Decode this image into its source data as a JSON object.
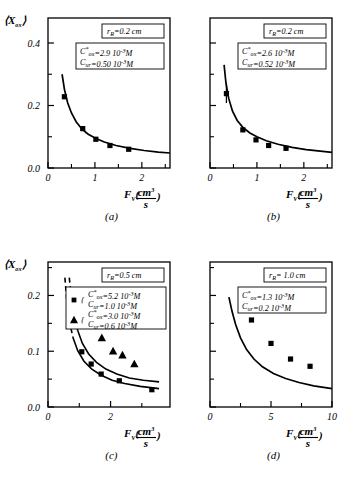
{
  "figure": {
    "n_panels": 4,
    "background": "#ffffff",
    "ink": "#000000"
  },
  "axis": {
    "ylabel_main": "⟨X",
    "ylabel_sub": "ox",
    "ylabel_close": "⟩",
    "xlabel_f": "F",
    "xlabel_v": "V",
    "xlabel_num": "cm",
    "xlabel_num_sup": "3",
    "xlabel_den": "s"
  },
  "chart_data": [
    {
      "type": "scatter",
      "panel": "a",
      "panel_label": "(a)",
      "title": "",
      "xlabel": "F_V (cm^3/s)",
      "ylabel": "<X_ox>",
      "xlim": [
        0,
        2.6
      ],
      "ylim": [
        0.0,
        0.48
      ],
      "xticks": [
        0,
        1,
        2
      ],
      "xticklabels": [
        "0",
        "1",
        "2"
      ],
      "xminorticks": [
        0.5,
        1.5,
        2.5
      ],
      "yticks": [
        0.0,
        0.2,
        0.4
      ],
      "yticklabels": [
        "0.0",
        "0.2",
        "0.4"
      ],
      "yminorticks": [
        0.1,
        0.3
      ],
      "grid": false,
      "annotations": [
        {
          "name": "radius-box",
          "lines": [
            "r_R = 0.2 cm"
          ]
        },
        {
          "name": "concentration-box",
          "lines": [
            "C*ox = 2.9   10^-3 M",
            "Cur = 0.50   10^-3 M"
          ]
        }
      ],
      "box_radius": {
        "var": "r",
        "sub": "R",
        "eq": "=0.2",
        "unit": "cm"
      },
      "box_conc": {
        "row1": {
          "var": "C",
          "sup": "*",
          "sub": "ox",
          "eq": "=2.9",
          "exp_base": "10",
          "exp": "-3",
          "unit": "M"
        },
        "row2": {
          "var": "C",
          "sup": "",
          "sub": "ur",
          "eq": "=0.50",
          "exp_base": "10",
          "exp": "-3",
          "unit": "M"
        }
      },
      "series": [
        {
          "name": "measured",
          "marker": "square",
          "points": [
            {
              "x": 0.35,
              "y": 0.228,
              "err": 0
            },
            {
              "x": 0.74,
              "y": 0.126,
              "err": 0
            },
            {
              "x": 1.02,
              "y": 0.092,
              "err": 0
            },
            {
              "x": 1.32,
              "y": 0.072,
              "err": 0
            },
            {
              "x": 1.72,
              "y": 0.06,
              "err": 0
            }
          ]
        }
      ],
      "curves": [
        {
          "name": "model-solid",
          "style": "solid",
          "points": [
            {
              "x": 0.3,
              "y": 0.3
            },
            {
              "x": 0.35,
              "y": 0.252
            },
            {
              "x": 0.42,
              "y": 0.208
            },
            {
              "x": 0.5,
              "y": 0.176
            },
            {
              "x": 0.6,
              "y": 0.148
            },
            {
              "x": 0.72,
              "y": 0.125
            },
            {
              "x": 0.85,
              "y": 0.109
            },
            {
              "x": 1.0,
              "y": 0.096
            },
            {
              "x": 1.2,
              "y": 0.083
            },
            {
              "x": 1.45,
              "y": 0.072
            },
            {
              "x": 1.75,
              "y": 0.063
            },
            {
              "x": 2.05,
              "y": 0.056
            },
            {
              "x": 2.35,
              "y": 0.051
            },
            {
              "x": 2.6,
              "y": 0.048
            }
          ]
        }
      ]
    },
    {
      "type": "scatter",
      "panel": "b",
      "panel_label": "(b)",
      "title": "",
      "xlabel": "F_V (cm^3/s)",
      "ylabel": "",
      "xlim": [
        0,
        2.6
      ],
      "ylim": [
        0.0,
        0.48
      ],
      "xticks": [
        0,
        1,
        2
      ],
      "xticklabels": [
        "0",
        "1",
        "2"
      ],
      "xminorticks": [
        0.5,
        1.5,
        2.5
      ],
      "yticks": [
        0.0,
        0.2,
        0.4
      ],
      "yticklabels": [
        "",
        "",
        ""
      ],
      "yminorticks": [
        0.1,
        0.3
      ],
      "grid": false,
      "box_radius": {
        "var": "r",
        "sub": "R",
        "eq": "=0.2",
        "unit": "cm"
      },
      "box_conc": {
        "row1": {
          "var": "C",
          "sup": "*",
          "sub": "ox",
          "eq": "=2.6",
          "exp_base": "10",
          "exp": "-3",
          "unit": "M"
        },
        "row2": {
          "var": "C",
          "sup": "",
          "sub": "ur",
          "eq": "=0.52",
          "exp_base": "10",
          "exp": "-3",
          "unit": "M"
        }
      },
      "series": [
        {
          "name": "measured",
          "marker": "square",
          "points": [
            {
              "x": 0.35,
              "y": 0.238,
              "err": 0.03
            },
            {
              "x": 0.7,
              "y": 0.122,
              "err": 0
            },
            {
              "x": 0.98,
              "y": 0.09,
              "err": 0
            },
            {
              "x": 1.25,
              "y": 0.072,
              "err": 0
            },
            {
              "x": 1.62,
              "y": 0.063,
              "err": 0
            }
          ]
        }
      ],
      "curves": [
        {
          "name": "model-solid",
          "style": "solid",
          "points": [
            {
              "x": 0.3,
              "y": 0.33
            },
            {
              "x": 0.34,
              "y": 0.272
            },
            {
              "x": 0.4,
              "y": 0.222
            },
            {
              "x": 0.48,
              "y": 0.182
            },
            {
              "x": 0.58,
              "y": 0.152
            },
            {
              "x": 0.7,
              "y": 0.13
            },
            {
              "x": 0.85,
              "y": 0.112
            },
            {
              "x": 1.0,
              "y": 0.1
            },
            {
              "x": 1.2,
              "y": 0.087
            },
            {
              "x": 1.45,
              "y": 0.076
            },
            {
              "x": 1.75,
              "y": 0.066
            },
            {
              "x": 2.05,
              "y": 0.059
            },
            {
              "x": 2.35,
              "y": 0.054
            },
            {
              "x": 2.6,
              "y": 0.05
            }
          ]
        }
      ]
    },
    {
      "type": "scatter",
      "panel": "c",
      "panel_label": "(c)",
      "title": "",
      "xlabel": "F_V (cm^3/s)",
      "ylabel": "<X_ox>",
      "xlim": [
        0,
        3.9
      ],
      "ylim": [
        0.0,
        0.26
      ],
      "xticks": [
        0,
        2,
        4
      ],
      "xticklabels": [
        "0",
        "2",
        "4"
      ],
      "xminorticks": [
        1,
        3
      ],
      "yticks": [
        0.0,
        0.1,
        0.2
      ],
      "yticklabels": [
        "0.0",
        "0.1",
        "0.2"
      ],
      "yminorticks": [
        0.05,
        0.15,
        0.25
      ],
      "grid": false,
      "box_radius": {
        "var": "r",
        "sub": "R",
        "eq": "=0.5",
        "unit": "cm"
      },
      "legend": {
        "position": "top-right",
        "entries": [
          {
            "marker": "square",
            "row1": {
              "var": "C",
              "sup": "*",
              "sub": "ox",
              "eq": "=5.2",
              "exp_base": "10",
              "exp": "-3",
              "unit": "M"
            },
            "row2": {
              "var": "C",
              "sup": "",
              "sub": "ur",
              "eq": "=1.0",
              "exp_base": "10",
              "exp": "-3",
              "unit": "M"
            }
          },
          {
            "marker": "triangle",
            "row1": {
              "var": "C",
              "sup": "*",
              "sub": "ox",
              "eq": "=3.0",
              "exp_base": "10",
              "exp": "-3",
              "unit": "M"
            },
            "row2": {
              "var": "C",
              "sup": "",
              "sub": "ur",
              "eq": "=0.6",
              "exp_base": "10",
              "exp": "-3",
              "unit": "M"
            }
          }
        ]
      },
      "series": [
        {
          "name": "Cox-5.2",
          "marker": "square",
          "points": [
            {
              "x": 1.08,
              "y": 0.099
            },
            {
              "x": 1.38,
              "y": 0.077
            },
            {
              "x": 1.7,
              "y": 0.059
            },
            {
              "x": 2.28,
              "y": 0.047
            },
            {
              "x": 3.32,
              "y": 0.031
            }
          ]
        },
        {
          "name": "Cox-3.0",
          "marker": "triangle",
          "points": [
            {
              "x": 1.12,
              "y": 0.198
            },
            {
              "x": 1.42,
              "y": 0.153
            },
            {
              "x": 1.72,
              "y": 0.124
            },
            {
              "x": 2.08,
              "y": 0.1
            },
            {
              "x": 2.38,
              "y": 0.093
            },
            {
              "x": 2.76,
              "y": 0.077
            }
          ]
        }
      ],
      "curves": [
        {
          "name": "upper-model",
          "style": "dashed-then-solid",
          "dash_end_x": 0.95,
          "points": [
            {
              "x": 0.68,
              "y": 0.232
            },
            {
              "x": 0.75,
              "y": 0.196
            },
            {
              "x": 0.85,
              "y": 0.16
            },
            {
              "x": 0.95,
              "y": 0.137
            },
            {
              "x": 1.1,
              "y": 0.114
            },
            {
              "x": 1.3,
              "y": 0.095
            },
            {
              "x": 1.55,
              "y": 0.08
            },
            {
              "x": 1.85,
              "y": 0.068
            },
            {
              "x": 2.2,
              "y": 0.059
            },
            {
              "x": 2.6,
              "y": 0.052
            },
            {
              "x": 3.05,
              "y": 0.048
            },
            {
              "x": 3.55,
              "y": 0.045
            }
          ]
        },
        {
          "name": "lower-model",
          "style": "dashed-then-solid",
          "dash_end_x": 0.8,
          "points": [
            {
              "x": 0.54,
              "y": 0.232
            },
            {
              "x": 0.6,
              "y": 0.192
            },
            {
              "x": 0.68,
              "y": 0.155
            },
            {
              "x": 0.8,
              "y": 0.124
            },
            {
              "x": 0.95,
              "y": 0.101
            },
            {
              "x": 1.15,
              "y": 0.082
            },
            {
              "x": 1.4,
              "y": 0.068
            },
            {
              "x": 1.7,
              "y": 0.057
            },
            {
              "x": 2.05,
              "y": 0.048
            },
            {
              "x": 2.45,
              "y": 0.042
            },
            {
              "x": 2.95,
              "y": 0.037
            },
            {
              "x": 3.55,
              "y": 0.033
            }
          ]
        }
      ]
    },
    {
      "type": "scatter",
      "panel": "d",
      "panel_label": "(d)",
      "title": "",
      "xlabel": "F_V (cm^3/s)",
      "ylabel": "",
      "xlim": [
        0,
        10
      ],
      "ylim": [
        0.0,
        0.26
      ],
      "xticks": [
        0,
        5,
        10
      ],
      "xticklabels": [
        "0",
        "5",
        "10"
      ],
      "xminorticks": [
        2.5,
        7.5
      ],
      "yticks": [
        0.0,
        0.1,
        0.2
      ],
      "yticklabels": [
        "",
        "",
        ""
      ],
      "yminorticks": [
        0.05,
        0.15,
        0.25
      ],
      "grid": false,
      "box_radius": {
        "var": "r",
        "sub": "R",
        "eq": "= 1.0",
        "unit": "cm"
      },
      "box_conc": {
        "row1": {
          "var": "C",
          "sup": "*",
          "sub": "ox",
          "eq": "=1.3",
          "exp_base": "10",
          "exp": "-3",
          "unit": "M"
        },
        "row2": {
          "var": "C",
          "sup": "",
          "sub": "ur",
          "eq": "=0.2",
          "exp_base": "10",
          "exp": "-3",
          "unit": "M"
        }
      },
      "series": [
        {
          "name": "measured",
          "marker": "square",
          "points": [
            {
              "x": 3.4,
              "y": 0.156
            },
            {
              "x": 5.0,
              "y": 0.114
            },
            {
              "x": 6.6,
              "y": 0.086
            },
            {
              "x": 8.2,
              "y": 0.073
            }
          ]
        }
      ],
      "curves": [
        {
          "name": "model-solid",
          "style": "solid",
          "points": [
            {
              "x": 1.55,
              "y": 0.197
            },
            {
              "x": 1.8,
              "y": 0.172
            },
            {
              "x": 2.1,
              "y": 0.148
            },
            {
              "x": 2.5,
              "y": 0.124
            },
            {
              "x": 3.0,
              "y": 0.103
            },
            {
              "x": 3.6,
              "y": 0.086
            },
            {
              "x": 4.3,
              "y": 0.072
            },
            {
              "x": 5.2,
              "y": 0.06
            },
            {
              "x": 6.2,
              "y": 0.051
            },
            {
              "x": 7.3,
              "y": 0.044
            },
            {
              "x": 8.5,
              "y": 0.038
            },
            {
              "x": 10.0,
              "y": 0.033
            }
          ]
        }
      ]
    }
  ]
}
